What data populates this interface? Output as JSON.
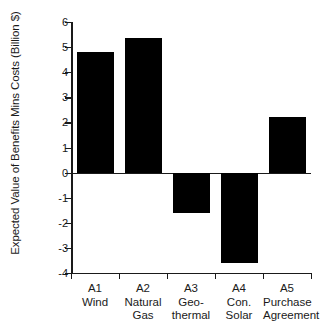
{
  "chart_data": {
    "type": "bar",
    "title": "",
    "xlabel": "",
    "ylabel": "Expected Value of Benefits Mins Costs (Billion $)",
    "ylim": [
      -4,
      6
    ],
    "ytick_step": 1,
    "yticks": [
      6,
      5,
      4,
      3,
      2,
      1,
      0,
      -1,
      -2,
      -3,
      -4
    ],
    "ytick_labels": [
      "6",
      "5",
      "4",
      "3",
      "2",
      "1",
      "0",
      "-1",
      "-2",
      "-3",
      "-4"
    ],
    "grid": false,
    "legend": null,
    "bar_color": "#000000",
    "background_color": "#ffffff",
    "axis_color": "#1a1a1a",
    "categories": [
      "A1 Wind",
      "A2 Natural Gas",
      "A3 Geo-thermal",
      "A4 Con. Solar",
      "A5 Purchase Agreement"
    ],
    "values": [
      4.8,
      5.35,
      -1.6,
      -3.6,
      2.2
    ],
    "points": [
      {
        "code": "A1",
        "name": "Wind",
        "name_lines": [
          "Wind"
        ],
        "value": 4.8
      },
      {
        "code": "A2",
        "name": "Natural Gas",
        "name_lines": [
          "Natural",
          "Gas"
        ],
        "value": 5.35
      },
      {
        "code": "A3",
        "name": "Geo-thermal",
        "name_lines": [
          "Geo-",
          "thermal"
        ],
        "value": -1.6
      },
      {
        "code": "A4",
        "name": "Con. Solar",
        "name_lines": [
          "Con.",
          "Solar"
        ],
        "value": -3.6
      },
      {
        "code": "A5",
        "name": "Purchase Agreement",
        "name_lines": [
          "Purchase",
          "Agreement"
        ],
        "value": 2.2
      }
    ]
  }
}
